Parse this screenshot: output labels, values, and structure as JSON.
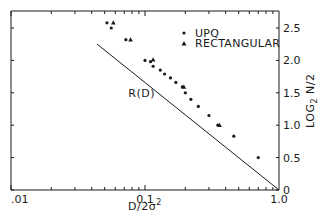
{
  "chart_data": {
    "type": "scatter",
    "title": "",
    "xlabel": "D/2σ²",
    "ylabel": "LOG₂ N/2",
    "xscale": "log",
    "xlim": [
      0.01,
      1.0
    ],
    "ylim": [
      0,
      2.5
    ],
    "x_ticks": [
      {
        "value": 0.01,
        "label": ".01"
      },
      {
        "value": 0.1,
        "label": "0.1"
      },
      {
        "value": 1.0,
        "label": "1.0"
      }
    ],
    "y_ticks": [
      {
        "value": 0,
        "label": "0"
      },
      {
        "value": 0.5,
        "label": "0.5"
      },
      {
        "value": 1.0,
        "label": "1.0"
      },
      {
        "value": 1.5,
        "label": "1.5"
      },
      {
        "value": 2.0,
        "label": "2.0"
      },
      {
        "value": 2.5,
        "label": "2.5"
      }
    ],
    "y_axis_position": "right",
    "grid": false,
    "legend_position": "upper right (inside)",
    "series": [
      {
        "name": "UPQ",
        "marker": "circle",
        "points": [
          {
            "x": 0.052,
            "y": 2.58
          },
          {
            "x": 0.056,
            "y": 2.5
          },
          {
            "x": 0.072,
            "y": 2.32
          },
          {
            "x": 0.1,
            "y": 2.0
          },
          {
            "x": 0.11,
            "y": 1.98
          },
          {
            "x": 0.115,
            "y": 1.91
          },
          {
            "x": 0.13,
            "y": 1.85
          },
          {
            "x": 0.14,
            "y": 1.79
          },
          {
            "x": 0.155,
            "y": 1.73
          },
          {
            "x": 0.17,
            "y": 1.66
          },
          {
            "x": 0.19,
            "y": 1.59
          },
          {
            "x": 0.2,
            "y": 1.5
          },
          {
            "x": 0.22,
            "y": 1.4
          },
          {
            "x": 0.25,
            "y": 1.29
          },
          {
            "x": 0.3,
            "y": 1.15
          },
          {
            "x": 0.35,
            "y": 1.0
          },
          {
            "x": 0.46,
            "y": 0.83
          },
          {
            "x": 0.7,
            "y": 0.5
          }
        ]
      },
      {
        "name": "RECTANGULAR",
        "marker": "triangle",
        "points": [
          {
            "x": 0.058,
            "y": 2.58
          },
          {
            "x": 0.078,
            "y": 2.32
          },
          {
            "x": 0.115,
            "y": 2.01
          },
          {
            "x": 0.195,
            "y": 1.59
          },
          {
            "x": 0.36,
            "y": 1.0
          }
        ]
      },
      {
        "name": "R(D)",
        "marker": "line",
        "points": [
          {
            "x": 0.044,
            "y": 2.25
          },
          {
            "x": 1.0,
            "y": 0.0
          }
        ]
      }
    ],
    "annotations": [
      {
        "text": "R(D)",
        "x": 0.075,
        "y": 1.5
      }
    ]
  },
  "legend": {
    "items": [
      {
        "label": "UPQ",
        "marker": "circle"
      },
      {
        "label": "RECTANGULAR",
        "marker": "triangle"
      }
    ]
  },
  "labels": {
    "xlabel_main": "D/2σ",
    "xlabel_sup": "2",
    "ylabel_main": "LOG",
    "ylabel_sub": "2",
    "ylabel_rest": " N/2",
    "rd_annotation": "R(D)"
  },
  "colors": {
    "ink": "#1a1a1a",
    "background": "#ffffff"
  }
}
